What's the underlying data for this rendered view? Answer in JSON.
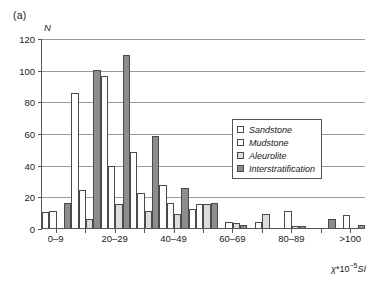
{
  "figure": {
    "panel_label": "(a)",
    "y_axis_title": "N",
    "x_axis_title_chi": "χ",
    "x_axis_title_mid": "*10",
    "x_axis_title_exp": "−5",
    "x_axis_title_unit": "SI"
  },
  "legend": {
    "items": [
      {
        "label": "Sandstone",
        "color": "#ffffff"
      },
      {
        "label": "Mudstone",
        "color": "#fcfcfc"
      },
      {
        "label": "Aleurolite",
        "color": "#dcdcdc"
      },
      {
        "label": "Interstratification",
        "color": "#8d8d8d"
      }
    ]
  },
  "chart_data": {
    "type": "bar",
    "title": "(a)",
    "xlabel": "χ*10−5SI",
    "ylabel": "N",
    "ylim": [
      0,
      120
    ],
    "yticks": [
      0,
      20,
      40,
      60,
      80,
      100,
      120
    ],
    "ytick_labels": [
      "0",
      "20",
      "40",
      "60",
      "80",
      "100",
      "120"
    ],
    "grid": true,
    "legend_position": "right-middle",
    "categories": [
      "0–9",
      "10–19",
      "20–29",
      "30–39",
      "40–49",
      "50–59",
      "60–69",
      "70–79",
      "80–89",
      "90–99",
      ">100"
    ],
    "visible_tick_labels": [
      "0–9",
      "",
      "20–29",
      "",
      "40–49",
      "",
      "60–69",
      "",
      "80–89",
      "",
      ">100"
    ],
    "series": [
      {
        "name": "Sandstone",
        "color": "#ffffff",
        "values": [
          10,
          85,
          96,
          48,
          27,
          12,
          0,
          0,
          0,
          0,
          0
        ]
      },
      {
        "name": "Mudstone",
        "color": "#fcfcfc",
        "values": [
          11,
          24,
          39,
          22,
          16,
          15,
          4,
          4,
          11,
          0,
          8
        ]
      },
      {
        "name": "Aleurolite",
        "color": "#dcdcdc",
        "values": [
          0,
          6,
          15,
          11,
          9,
          15,
          3,
          9,
          1,
          0,
          0
        ]
      },
      {
        "name": "Interstratification",
        "color": "#8d8d8d",
        "values": [
          16,
          100,
          109,
          58,
          25,
          16,
          2,
          0,
          1,
          6,
          2
        ]
      }
    ]
  }
}
